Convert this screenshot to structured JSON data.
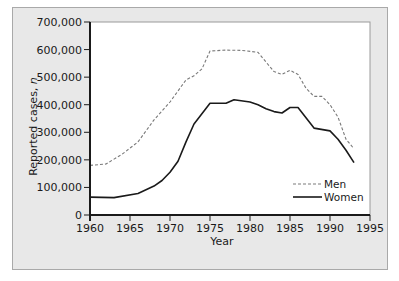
{
  "chart_data": {
    "type": "line",
    "title": "",
    "xlabel": "Year",
    "ylabel": "Reported cases, n",
    "xlim": [
      1960,
      1995
    ],
    "ylim": [
      0,
      700000
    ],
    "xticks": [
      1960,
      1965,
      1970,
      1975,
      1980,
      1985,
      1990,
      1995
    ],
    "xtick_labels": [
      "1960",
      "1965",
      "1970",
      "1975",
      "1980",
      "1985",
      "1990",
      "1995"
    ],
    "yticks": [
      0,
      100000,
      200000,
      300000,
      400000,
      500000,
      600000,
      700000
    ],
    "ytick_labels": [
      "0",
      "100,000",
      "200,000",
      "300,000",
      "400,000",
      "500,000",
      "600,000",
      "700,000"
    ],
    "grid": false,
    "legend_position": "lower right",
    "series": [
      {
        "name": "Men",
        "style": "dashed",
        "color": "#7a7a7a",
        "x": [
          1960,
          1962,
          1964,
          1966,
          1968,
          1970,
          1972,
          1973,
          1974,
          1975,
          1977,
          1979,
          1981,
          1982,
          1983,
          1984,
          1985,
          1986,
          1987,
          1988,
          1989,
          1990,
          1991,
          1992,
          1993
        ],
        "values": [
          180000,
          185000,
          220000,
          265000,
          345000,
          410000,
          490000,
          505000,
          530000,
          595000,
          598000,
          597000,
          590000,
          555000,
          520000,
          510000,
          525000,
          510000,
          460000,
          430000,
          430000,
          400000,
          355000,
          275000,
          240000
        ]
      },
      {
        "name": "Women",
        "style": "solid",
        "color": "#1a1a1a",
        "x": [
          1960,
          1963,
          1966,
          1968,
          1969,
          1970,
          1971,
          1972,
          1973,
          1975,
          1977,
          1978,
          1980,
          1981,
          1982,
          1983,
          1984,
          1985,
          1986,
          1988,
          1990,
          1991,
          1992,
          1993
        ],
        "values": [
          65000,
          63000,
          78000,
          105000,
          125000,
          155000,
          195000,
          265000,
          330000,
          405000,
          405000,
          418000,
          410000,
          400000,
          385000,
          375000,
          370000,
          390000,
          390000,
          315000,
          305000,
          275000,
          235000,
          190000
        ]
      }
    ]
  },
  "colors": {
    "panel_bg": "#e8e8e8",
    "plot_bg": "#ffffff",
    "axis": "#1a1a1a"
  }
}
